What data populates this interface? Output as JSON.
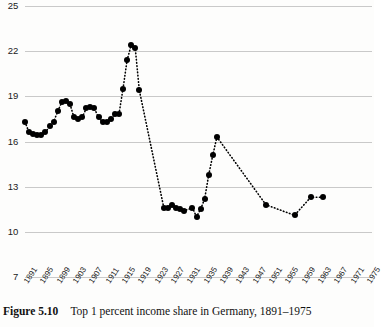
{
  "figure": {
    "label": "Figure 5.10",
    "caption": "Top 1 percent income share in Germany, 1891–1975"
  },
  "chart_data": {
    "type": "scatter",
    "title": "Top 1 percent income share in Germany, 1891–1975",
    "xlabel": "",
    "ylabel": "",
    "ylim": [
      7,
      25
    ],
    "xlim": [
      1891,
      1975
    ],
    "grid": true,
    "legend": false,
    "marker": "filled-circle",
    "connector": "dotted",
    "yticks": [
      7,
      10,
      13,
      16,
      19,
      22,
      25
    ],
    "ytick_labels": [
      "7",
      "10",
      "13",
      "16",
      "19",
      "22",
      "25"
    ],
    "xticks": [
      1891,
      1895,
      1899,
      1903,
      1907,
      1911,
      1915,
      1919,
      1923,
      1927,
      1931,
      1935,
      1939,
      1943,
      1947,
      1951,
      1955,
      1959,
      1963,
      1967,
      1971,
      1975
    ],
    "xtick_labels": [
      "1891",
      "1895",
      "1899",
      "1903",
      "1907",
      "1911",
      "1915",
      "1919",
      "1923",
      "1927",
      "1931",
      "1935",
      "1939",
      "1943",
      "1947",
      "1951",
      "1955",
      "1959",
      "1963",
      "1967",
      "1971",
      "1975"
    ],
    "series": [
      {
        "name": "Top 1 percent income share",
        "x": [
          1891,
          1892,
          1893,
          1894,
          1895,
          1896,
          1897,
          1898,
          1899,
          1900,
          1901,
          1902,
          1903,
          1904,
          1905,
          1906,
          1907,
          1908,
          1909,
          1910,
          1911,
          1912,
          1913,
          1914,
          1915,
          1916,
          1917,
          1918,
          1919,
          1925,
          1926,
          1927,
          1928,
          1929,
          1930,
          1931,
          1932,
          1933,
          1934,
          1935,
          1936,
          1937,
          1938,
          1950,
          1954,
          1955,
          1957,
          1959,
          1961,
          1964
        ],
        "values": [
          17.3,
          16.6,
          16.5,
          16.4,
          16.5,
          16.7,
          17.1,
          17.8,
          18.4,
          18.7,
          18.6,
          17.6,
          17.5,
          17.7,
          18.2,
          18.3,
          17.6,
          17.3,
          17.3,
          17.5,
          17.8,
          17.8,
          19.5,
          21.4,
          22.4,
          22.2,
          19.4,
          11.6,
          11.6,
          11.8,
          11.6,
          11.5,
          11.7,
          11.5,
          11.0,
          11.5,
          12.2,
          13.8,
          15.1,
          16.3,
          11.8,
          11.1,
          12.3,
          12.3,
          11.8,
          11.1,
          12.3,
          12.3,
          11.8,
          12.3
        ],
        "color": "#000000"
      }
    ],
    "annotations": [
      {
        "text": "WWI peak",
        "year": 1917,
        "value": 22.4
      },
      {
        "text": "WWII peak",
        "year": 1938,
        "value": 16.3
      }
    ]
  },
  "points": [
    {
      "year": 1891,
      "value": 17.3
    },
    {
      "year": 1892,
      "value": 16.6
    },
    {
      "year": 1893,
      "value": 16.5
    },
    {
      "year": 1894,
      "value": 16.4
    },
    {
      "year": 1895,
      "value": 16.4
    },
    {
      "year": 1896,
      "value": 16.6
    },
    {
      "year": 1897,
      "value": 17.0
    },
    {
      "year": 1898,
      "value": 17.3
    },
    {
      "year": 1899,
      "value": 18.0
    },
    {
      "year": 1900,
      "value": 18.6
    },
    {
      "year": 1901,
      "value": 18.7
    },
    {
      "year": 1902,
      "value": 18.5
    },
    {
      "year": 1903,
      "value": 17.6
    },
    {
      "year": 1904,
      "value": 17.5
    },
    {
      "year": 1905,
      "value": 17.6
    },
    {
      "year": 1906,
      "value": 18.2
    },
    {
      "year": 1907,
      "value": 18.3
    },
    {
      "year": 1908,
      "value": 18.2
    },
    {
      "year": 1909,
      "value": 17.6
    },
    {
      "year": 1910,
      "value": 17.3
    },
    {
      "year": 1911,
      "value": 17.3
    },
    {
      "year": 1912,
      "value": 17.5
    },
    {
      "year": 1913,
      "value": 17.8
    },
    {
      "year": 1914,
      "value": 17.8
    },
    {
      "year": 1915,
      "value": 19.5
    },
    {
      "year": 1916,
      "value": 21.4
    },
    {
      "year": 1917,
      "value": 22.4
    },
    {
      "year": 1918,
      "value": 22.2
    },
    {
      "year": 1919,
      "value": 19.4
    },
    {
      "year": 1925,
      "value": 11.6
    },
    {
      "year": 1926,
      "value": 11.6
    },
    {
      "year": 1927,
      "value": 11.8
    },
    {
      "year": 1928,
      "value": 11.6
    },
    {
      "year": 1929,
      "value": 11.5
    },
    {
      "year": 1930,
      "value": 11.4
    },
    {
      "year": 1932,
      "value": 11.6
    },
    {
      "year": 1933,
      "value": 11.0
    },
    {
      "year": 1934,
      "value": 11.5
    },
    {
      "year": 1935,
      "value": 12.2
    },
    {
      "year": 1936,
      "value": 13.8
    },
    {
      "year": 1937,
      "value": 15.1
    },
    {
      "year": 1938,
      "value": 16.3
    },
    {
      "year": 1950,
      "value": 11.8
    },
    {
      "year": 1957,
      "value": 11.1
    },
    {
      "year": 1961,
      "value": 12.3
    },
    {
      "year": 1964,
      "value": 12.3
    }
  ]
}
